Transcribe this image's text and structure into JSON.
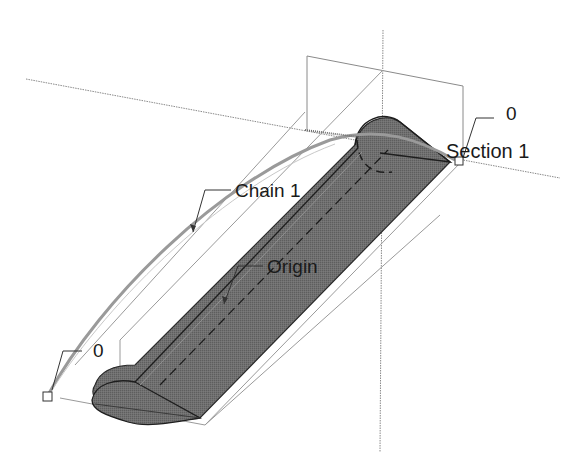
{
  "labels": {
    "section": "Section 1",
    "section_index": "0",
    "chain": "Chain 1",
    "origin": "Origin",
    "start_index": "0"
  },
  "colors": {
    "background": "#ffffff",
    "solid_fill": "#6e6e6e",
    "solid_edge": "#2a2a2a",
    "construction_line": "#8a8a8a",
    "chain_curve": "#9a9a9a",
    "text": "#1a1a1a"
  }
}
